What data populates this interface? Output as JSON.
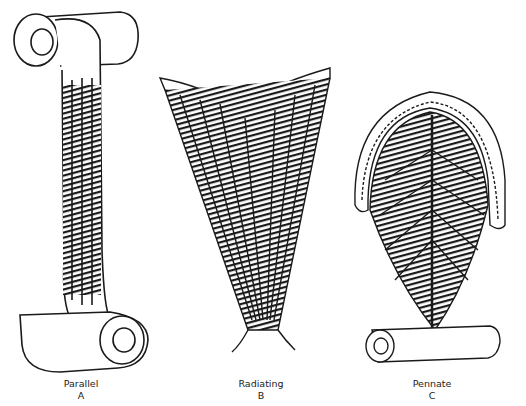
{
  "figures": [
    {
      "id": "A",
      "name": "Parallel",
      "letter": "A",
      "type": "parallel-muscle"
    },
    {
      "id": "B",
      "name": "Radiating",
      "letter": "B",
      "type": "radiating-muscle"
    },
    {
      "id": "C",
      "name": "Pennate",
      "letter": "C",
      "type": "pennate-muscle"
    }
  ],
  "colors": {
    "ink": "#1a1a1a",
    "background": "#ffffff"
  }
}
